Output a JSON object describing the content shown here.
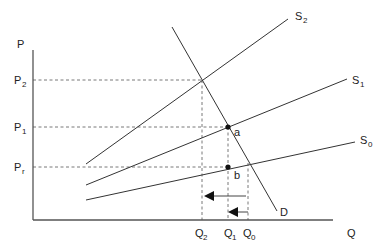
{
  "axes": {
    "y_label": "P",
    "x_label": "Q"
  },
  "price_levels": [
    {
      "id": "P2",
      "base": "P",
      "sub": "2",
      "y": 80
    },
    {
      "id": "P1",
      "base": "P",
      "sub": "1",
      "y": 127
    },
    {
      "id": "Pr",
      "base": "P",
      "sub": "r",
      "y": 167
    }
  ],
  "quantity_levels": [
    {
      "id": "Q2",
      "base": "Q",
      "sub": "2",
      "x": 202
    },
    {
      "id": "Q1",
      "base": "Q",
      "sub": "1",
      "x": 228
    },
    {
      "id": "Q0",
      "base": "Q",
      "sub": "0",
      "x": 248
    }
  ],
  "curves": {
    "demand": {
      "label": "D"
    },
    "supply": [
      {
        "base": "S",
        "sub": "2"
      },
      {
        "base": "S",
        "sub": "1"
      },
      {
        "base": "S",
        "sub": "0"
      }
    ]
  },
  "points": [
    {
      "label": "a",
      "x": 228,
      "y": 127
    },
    {
      "label": "b",
      "x": 228,
      "y": 167
    }
  ],
  "colors": {
    "line": "#333333",
    "axis": "#555555",
    "background": "#ffffff"
  }
}
